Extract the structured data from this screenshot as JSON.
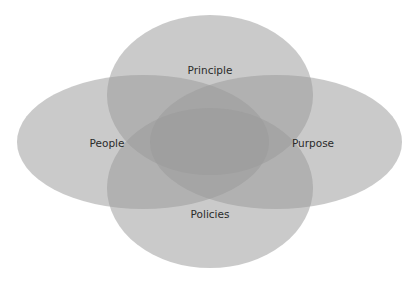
{
  "diagram": {
    "type": "venn",
    "ellipses": [
      {
        "label": "Principle",
        "cx": 210,
        "cy": 95,
        "rx": 103,
        "ry": 80
      },
      {
        "label": "People",
        "cx": 143,
        "cy": 142,
        "rx": 126,
        "ry": 67
      },
      {
        "label": "Purpose",
        "cx": 276,
        "cy": 142,
        "rx": 126,
        "ry": 67
      },
      {
        "label": "Policies",
        "cx": 210,
        "cy": 188,
        "rx": 103,
        "ry": 80
      }
    ],
    "labels": {
      "top": "Principle",
      "left": "People",
      "right": "Purpose",
      "bottom": "Policies"
    },
    "fill_color": "#9a9a9a",
    "text_color": "#2a2a2a"
  }
}
